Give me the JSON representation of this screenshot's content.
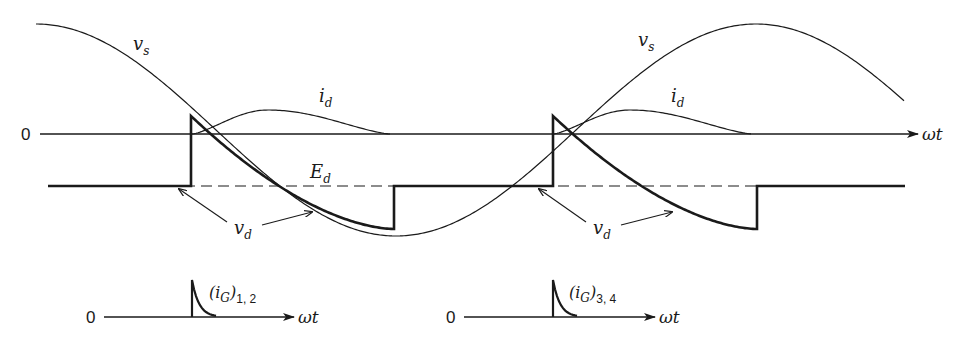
{
  "labels": {
    "zero_main": "0",
    "omega_t_main": "ωt",
    "vs_left": "v",
    "vs_left_sub": "s",
    "vs_right": "v",
    "vs_right_sub": "s",
    "id_left": "i",
    "id_left_sub": "d",
    "id_right": "i",
    "id_right_sub": "d",
    "ed": "E",
    "ed_sub": "d",
    "vd_left": "v",
    "vd_left_sub": "d",
    "vd_right": "v",
    "vd_right_sub": "d",
    "zero_g12": "0",
    "omega_t_g12": "ωt",
    "ig12_open": "(i",
    "ig12_G": "G",
    "ig12_close": ")",
    "ig12_sub": "1, 2",
    "zero_g34": "0",
    "omega_t_g34": "ωt",
    "ig34_open": "(i",
    "ig34_G": "G",
    "ig34_close": ")",
    "ig34_sub": "3, 4"
  },
  "colors": {
    "ink": "#1a1a1a",
    "background": "#ffffff"
  }
}
